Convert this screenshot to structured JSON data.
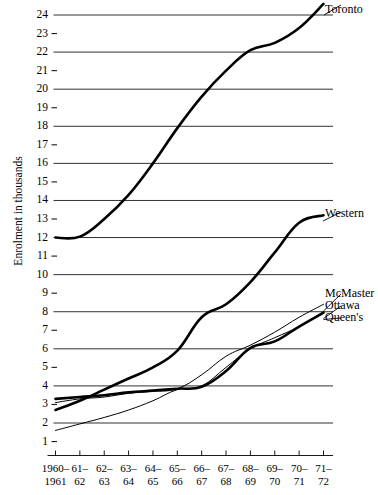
{
  "chart_data": {
    "type": "line",
    "title": "",
    "xlabel": "",
    "ylabel": "Enrolment in thousands",
    "ylim": [
      0,
      25
    ],
    "yticks": [
      1,
      2,
      3,
      4,
      5,
      6,
      7,
      8,
      9,
      10,
      11,
      12,
      13,
      14,
      15,
      16,
      17,
      18,
      19,
      20,
      21,
      22,
      23,
      24
    ],
    "ytick_labels": [
      "1",
      "2",
      "3",
      "4",
      "5",
      "6",
      "7",
      "8",
      "9",
      "10",
      "11",
      "12",
      "13",
      "14",
      "15",
      "16",
      "17",
      "18",
      "19",
      "20",
      "21",
      "22",
      "23",
      "24"
    ],
    "gridline_values": [
      2,
      4,
      6,
      8,
      10,
      12,
      14,
      16,
      18,
      20,
      22,
      24
    ],
    "tickdash_values": [
      1,
      3,
      5,
      7,
      9,
      11,
      13,
      15,
      17,
      19,
      21,
      23
    ],
    "grid": true,
    "legend_position": "right-inline-at-line-end",
    "categories": [
      "1960-1961",
      "61-62",
      "62-63",
      "63-64",
      "64-65",
      "65-66",
      "66-67",
      "67-68",
      "68-69",
      "69-70",
      "70-71",
      "71-72"
    ],
    "xtick_labels": [
      {
        "top": "1960–",
        "bottom": "1961"
      },
      {
        "top": "61–",
        "bottom": "62"
      },
      {
        "top": "62–",
        "bottom": "63"
      },
      {
        "top": "63–",
        "bottom": "64"
      },
      {
        "top": "64–",
        "bottom": "65"
      },
      {
        "top": "65–",
        "bottom": "66"
      },
      {
        "top": "66–",
        "bottom": "67"
      },
      {
        "top": "67–",
        "bottom": "68"
      },
      {
        "top": "68–",
        "bottom": "69"
      },
      {
        "top": "69–",
        "bottom": "70"
      },
      {
        "top": "70–",
        "bottom": "71"
      },
      {
        "top": "71–",
        "bottom": "72"
      }
    ],
    "series": [
      {
        "name": "Toronto",
        "label": "Toronto",
        "style": "thick",
        "color": "#000000",
        "values": [
          12.0,
          12.05,
          13.0,
          14.3,
          16.0,
          17.9,
          19.6,
          21.0,
          22.1,
          22.5,
          23.3,
          24.6
        ]
      },
      {
        "name": "Western",
        "label": "Western",
        "style": "thick",
        "color": "#000000",
        "values": [
          2.7,
          3.2,
          3.8,
          4.4,
          5.0,
          5.9,
          7.7,
          8.4,
          9.6,
          11.2,
          12.8,
          13.2
        ]
      },
      {
        "name": "McMaster",
        "label": "McMaster",
        "style": "thin",
        "color": "#000000",
        "values": [
          3.1,
          3.3,
          3.4,
          3.6,
          3.7,
          3.85,
          4.6,
          5.6,
          6.2,
          6.9,
          7.7,
          8.4
        ]
      },
      {
        "name": "Ottawa",
        "label": "Ottawa",
        "style": "thin",
        "color": "#000000",
        "values": [
          1.6,
          1.95,
          2.3,
          2.7,
          3.2,
          3.8,
          4.0,
          5.0,
          6.0,
          6.6,
          7.2,
          8.0
        ]
      },
      {
        "name": "Queen's",
        "label": "Queen's",
        "style": "thick",
        "color": "#000000",
        "values": [
          3.3,
          3.4,
          3.5,
          3.65,
          3.75,
          3.85,
          3.95,
          4.8,
          6.05,
          6.4,
          7.2,
          7.95
        ]
      }
    ]
  }
}
